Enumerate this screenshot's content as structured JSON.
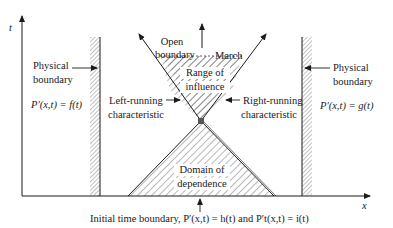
{
  "axes": {
    "t_label": "t",
    "x_label": "x"
  },
  "left_boundary": {
    "title_line1": "Physical",
    "title_line2": "boundary",
    "condition": "P′(x,t) = f(t)"
  },
  "right_boundary": {
    "title_line1": "Physical",
    "title_line2": "boundary",
    "condition": "P′(x,t) = g(t)"
  },
  "open_boundary": {
    "line1": "Open",
    "line2": "boundary"
  },
  "march_label": "March",
  "range_of_influence": {
    "line1": "Range of",
    "line2": "influence"
  },
  "domain_of_dependence": {
    "line1": "Domain of",
    "line2": "dependence"
  },
  "left_characteristic": {
    "line1": "Left-running",
    "line2": "characteristic"
  },
  "right_characteristic": {
    "line1": "Right-running",
    "line2": "characteristic"
  },
  "initial_boundary": {
    "text": "Initial time boundary, P′(x,t) = h(t) and P′t(x,t) = i(t)"
  },
  "colors": {
    "line": "#1a1a1a",
    "hatch": "#555555",
    "point": "#555555"
  }
}
